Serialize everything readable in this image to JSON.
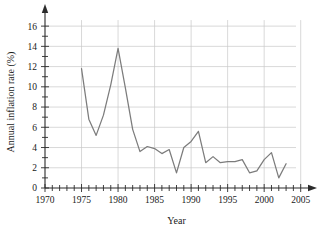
{
  "chart_data": {
    "type": "line",
    "title": "",
    "subtitle": "",
    "xlabel": "Year",
    "ylabel": "Annual inflation rate (%)",
    "xlim": [
      1970,
      2006
    ],
    "ylim": [
      0,
      17
    ],
    "grid": true,
    "legend": false,
    "legend_position": "none",
    "line_color": "#7c7c7c",
    "grid_color": "#c9c9c9",
    "axis_color": "#2b2b2b",
    "x_tick_labels": [
      "1970",
      "1975",
      "1980",
      "1985",
      "1990",
      "1995",
      "2000",
      "2005"
    ],
    "x_tick_values": [
      1970,
      1975,
      1980,
      1985,
      1990,
      1995,
      2000,
      2005
    ],
    "x_minor_tick_interval": 1,
    "y_tick_labels": [
      "0",
      "2",
      "4",
      "6",
      "8",
      "10",
      "12",
      "14",
      "16"
    ],
    "y_tick_values": [
      0,
      2,
      4,
      6,
      8,
      10,
      12,
      14,
      16
    ],
    "y_minor_tick_interval": 1,
    "x": [
      1975,
      1976,
      1977,
      1978,
      1979,
      1980,
      1981,
      1982,
      1983,
      1984,
      1985,
      1986,
      1987,
      1988,
      1989,
      1990,
      1991,
      1992,
      1993,
      1994,
      1995,
      1996,
      1997,
      1998,
      1999,
      2000,
      2001,
      2002,
      2003
    ],
    "values": [
      11.8,
      6.8,
      5.2,
      7.2,
      10.2,
      13.8,
      9.9,
      5.8,
      3.6,
      4.1,
      3.9,
      3.4,
      3.8,
      1.5,
      4.0,
      4.6,
      5.6,
      2.5,
      3.1,
      2.5,
      2.6,
      2.6,
      2.8,
      1.5,
      1.7,
      2.8,
      3.5,
      1.0,
      2.4
    ],
    "series": [
      {
        "name": "Annual inflation rate",
        "values": [
          11.8,
          6.8,
          5.2,
          7.2,
          10.2,
          13.8,
          9.9,
          5.8,
          3.6,
          4.1,
          3.9,
          3.4,
          3.8,
          1.5,
          4.0,
          4.6,
          5.6,
          2.5,
          3.1,
          2.5,
          2.6,
          2.6,
          2.8,
          1.5,
          1.7,
          2.8,
          3.5,
          1.0,
          2.4
        ]
      }
    ],
    "annotations": []
  }
}
